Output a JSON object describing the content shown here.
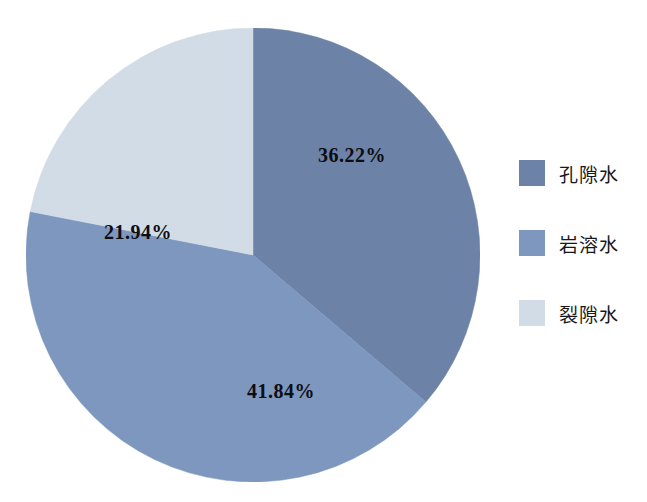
{
  "chart_data": {
    "type": "pie",
    "title": "",
    "categories": [
      "孔隙水",
      "岩溶水",
      "裂隙水"
    ],
    "values": [
      36.22,
      41.84,
      21.94
    ],
    "value_labels": [
      "36.22%",
      "41.84%",
      "21.94%"
    ],
    "unit": "%",
    "total": 100.0,
    "start_angle_deg": 0,
    "direction": "clockwise",
    "colors": [
      "#6C82A6",
      "#7D97BE",
      "#D2DCE6"
    ],
    "background": "#FFFFFF",
    "label_color": "#0D0D12",
    "legend_position": "right",
    "grid": false,
    "slices": [
      {
        "label": "孔隙水",
        "value": 36.22,
        "value_label": "36.22%",
        "color": "#6C82A6",
        "start_deg": 0.0,
        "end_deg": 130.39
      },
      {
        "label": "岩溶水",
        "value": 41.84,
        "value_label": "41.84%",
        "color": "#7D97BE",
        "start_deg": 130.39,
        "end_deg": 281.02
      },
      {
        "label": "裂隙水",
        "value": 21.94,
        "value_label": "21.94%",
        "color": "#D2DCE6",
        "start_deg": 281.02,
        "end_deg": 360.0
      }
    ]
  },
  "legend": {
    "items": [
      {
        "label": "孔隙水",
        "color": "#6C82A6"
      },
      {
        "label": "岩溶水",
        "color": "#7D97BE"
      },
      {
        "label": "裂隙水",
        "color": "#D2DCE6"
      }
    ]
  }
}
